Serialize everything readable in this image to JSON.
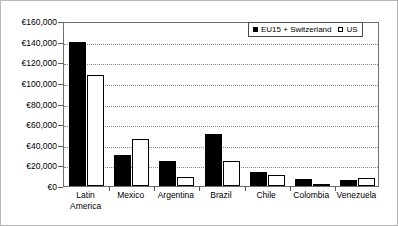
{
  "chart_data": {
    "type": "bar",
    "title": "",
    "xlabel": "",
    "ylabel": "",
    "grid": true,
    "legend_position": "top-right",
    "currency_symbol": "€",
    "categories": [
      "Latin America",
      "Mexico",
      "Argentina",
      "Brazil",
      "Chile",
      "Colombia",
      "Venezuela"
    ],
    "ylim": [
      0,
      160000
    ],
    "ytick_values": [
      0,
      20000,
      40000,
      60000,
      80000,
      100000,
      120000,
      140000,
      160000
    ],
    "ytick_labels": [
      "€0",
      "€20,000",
      "€40,000",
      "€60,000",
      "€80,000",
      "€100,000",
      "€120,000",
      "€140,000",
      "€160,000"
    ],
    "series": [
      {
        "name": "EU15 + Switzerland",
        "color": "#000000",
        "values": [
          140000,
          30000,
          24000,
          50000,
          14000,
          7000,
          6000
        ]
      },
      {
        "name": "US",
        "color": "#ffffff",
        "values": [
          108000,
          45500,
          9000,
          24000,
          11000,
          2000,
          8000
        ]
      }
    ]
  },
  "legend": {
    "entries": [
      {
        "label": "EU15 + Switzerland",
        "swatch": "filled"
      },
      {
        "label": "US",
        "swatch": "hollow"
      }
    ]
  },
  "y_axis": {
    "labels": [
      "€160,000",
      "€140,000",
      "€120,000",
      "€100,000",
      "€80,000",
      "€60,000",
      "€40,000",
      "€20,000",
      "€0"
    ]
  },
  "x_axis": {
    "labels": [
      {
        "line1": "Latin",
        "line2": "America"
      },
      {
        "line1": "Mexico",
        "line2": ""
      },
      {
        "line1": "Argentina",
        "line2": ""
      },
      {
        "line1": "Brazil",
        "line2": ""
      },
      {
        "line1": "Chile",
        "line2": ""
      },
      {
        "line1": "Colombia",
        "line2": ""
      },
      {
        "line1": "Venezuela",
        "line2": ""
      }
    ]
  }
}
